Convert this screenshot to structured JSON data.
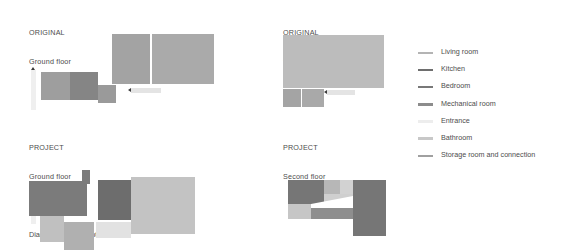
{
  "caption": "Diagram of space optimization",
  "colors": {
    "living_room": "#b4b4b4",
    "kitchen": "#6e6e6e",
    "bedroom": "#787878",
    "mechanical_room": "#8c8c8c",
    "entrance": "#efefef",
    "bathroom": "#c8c8c8",
    "storage_room": "#a0a0a0",
    "text": "#4d4d4d",
    "background": "#ffffff",
    "arrow": "#3a3a3a"
  },
  "legend": {
    "items": [
      {
        "label": "Living room",
        "color": "#b4b4b4"
      },
      {
        "label": "Kitchen",
        "color": "#6e6e6e"
      },
      {
        "label": "Bedroom",
        "color": "#787878"
      },
      {
        "label": "Mechanical room",
        "color": "#8c8c8c"
      },
      {
        "label": "Entrance",
        "color": "#ededed"
      },
      {
        "label": "Bathroom",
        "color": "#c8c8c8"
      },
      {
        "label": "Storage room and connection",
        "color": "#a0a0a0"
      }
    ]
  },
  "panels": [
    {
      "id": "original-ground",
      "title_line1": "ORIGINAL",
      "title_line2": "Ground floor",
      "rooms": [
        {
          "name": "bathroom",
          "color": "#9e9e9e",
          "x": 41,
          "y": 72,
          "w": 29,
          "h": 28
        },
        {
          "name": "mechanical-room",
          "color": "#858585",
          "x": 70,
          "y": 72,
          "w": 28,
          "h": 28
        },
        {
          "name": "storage-room",
          "color": "#9a9a9a",
          "x": 98,
          "y": 85,
          "w": 18,
          "h": 18
        },
        {
          "name": "bedroom",
          "color": "#a3a3a3",
          "x": 112,
          "y": 34,
          "w": 38,
          "h": 50
        },
        {
          "name": "living-room",
          "color": "#aaaaaa",
          "x": 152,
          "y": 34,
          "w": 62,
          "h": 50
        }
      ]
    },
    {
      "id": "original-second",
      "title_line1": "ORIGINAL",
      "title_line2": "Second floor",
      "rooms": [
        {
          "name": "living-room",
          "color": "#bcbcbc",
          "x": 283,
          "y": 35,
          "w": 101,
          "h": 53
        },
        {
          "name": "bedroom",
          "color": "#a4a4a4",
          "x": 283,
          "y": 89,
          "w": 18,
          "h": 18
        },
        {
          "name": "bathroom",
          "color": "#a9a9a9",
          "x": 302,
          "y": 89,
          "w": 22,
          "h": 18
        }
      ]
    },
    {
      "id": "project-ground",
      "title_line1": "PROJECT",
      "title_line2": "Ground floor",
      "rooms": [
        {
          "name": "kitchen",
          "color": "#7b7b7b",
          "x": 29,
          "y": 181,
          "w": 58,
          "h": 35
        },
        {
          "name": "kitchen-neck",
          "color": "#7b7b7b",
          "x": 82,
          "y": 170,
          "w": 8,
          "h": 14
        },
        {
          "name": "entrance-area",
          "color": "#c0c0c0",
          "x": 40,
          "y": 216,
          "w": 24,
          "h": 26
        },
        {
          "name": "bathroom",
          "color": "#b0b0b0",
          "x": 64,
          "y": 222,
          "w": 30,
          "h": 28
        },
        {
          "name": "storage-room",
          "color": "#e2e2e2",
          "x": 96,
          "y": 222,
          "w": 35,
          "h": 16
        },
        {
          "name": "mechanical-room",
          "color": "#6d6d6d",
          "x": 98,
          "y": 180,
          "w": 35,
          "h": 40
        },
        {
          "name": "living-room",
          "color": "#c3c3c3",
          "x": 131,
          "y": 177,
          "w": 64,
          "h": 57
        }
      ]
    },
    {
      "id": "project-second",
      "title_line1": "PROJECT",
      "title_line2": "Second floor",
      "rooms": [
        {
          "name": "bedroom-a",
          "color": "#767676",
          "x": 288,
          "y": 180,
          "w": 36,
          "h": 24
        },
        {
          "name": "bathroom",
          "color": "#b7b7b7",
          "x": 324,
          "y": 180,
          "w": 16,
          "h": 14
        },
        {
          "name": "storage-room",
          "color": "#d2d2d2",
          "x": 340,
          "y": 180,
          "w": 13,
          "h": 14
        },
        {
          "name": "connection",
          "color": "#cfcfcf",
          "x": 324,
          "y": 194,
          "w": 29,
          "h": 10
        },
        {
          "name": "entrance-strip",
          "color": "#c6c6c6",
          "x": 288,
          "y": 204,
          "w": 24,
          "h": 15
        },
        {
          "name": "mechanical-room",
          "color": "#8e8e8e",
          "x": 311,
          "y": 204,
          "w": 42,
          "h": 15
        },
        {
          "name": "bedroom-b",
          "color": "#767676",
          "x": 353,
          "y": 180,
          "w": 33,
          "h": 56
        }
      ]
    }
  ]
}
